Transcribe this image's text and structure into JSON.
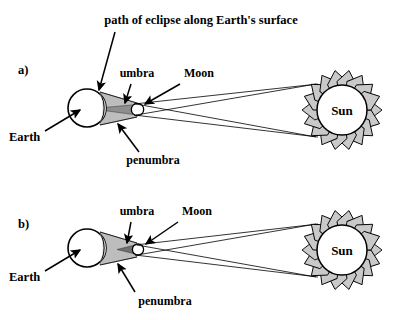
{
  "figure": {
    "title_text": "path of eclipse along Earth's surface",
    "colors": {
      "ink": "#000000",
      "shadow_gray": "#b8b8b8",
      "umbra_gray": "#9a9a9a",
      "sun_ray_gray": "#c9c9c9",
      "background": "#ffffff"
    }
  },
  "panels": [
    {
      "id": "a",
      "panel_label": "a)",
      "labels": {
        "path_of_eclipse": "path of eclipse along Earth's surface",
        "umbra": "umbra",
        "moon": "Moon",
        "earth": "Earth",
        "penumbra": "penumbra",
        "sun": "Sun"
      }
    },
    {
      "id": "b",
      "panel_label": "b)",
      "labels": {
        "umbra": "umbra",
        "moon": "Moon",
        "earth": "Earth",
        "penumbra": "penumbra",
        "sun": "Sun"
      }
    }
  ]
}
